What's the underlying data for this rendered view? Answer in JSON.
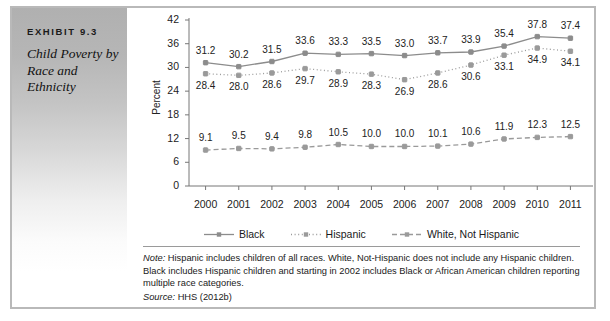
{
  "exhibit": {
    "label": "EXHIBIT 9.3",
    "title": "Child Poverty by Race and Ethnicity"
  },
  "notes": {
    "note_prefix": "Note:",
    "note_text": " Hispanic includes children of all races. White, Not-Hispanic does not include any Hispanic children. Black includes Hispanic children and starting in 2002 includes Black or African American children reporting multiple race categories.",
    "source_prefix": "Source:",
    "source_text": " HHS (2012b)"
  },
  "chart_data": {
    "type": "line",
    "title": "",
    "xlabel": "",
    "ylabel": "Percent",
    "ylim": [
      0,
      42
    ],
    "yticks": [
      0,
      6,
      12,
      18,
      24,
      30,
      36,
      42
    ],
    "grid": false,
    "legend_position": "bottom",
    "categories": [
      "2000",
      "2001",
      "2002",
      "2003",
      "2004",
      "2005",
      "2006",
      "2007",
      "2008",
      "2009",
      "2010",
      "2011"
    ],
    "series": [
      {
        "name": "Black",
        "style": "solid",
        "color": "#8c8c8c",
        "values": [
          31.2,
          30.2,
          31.5,
          33.6,
          33.3,
          33.5,
          33.0,
          33.7,
          33.9,
          35.4,
          37.8,
          37.4
        ],
        "label_offsets": [
          -1,
          -1,
          -1,
          -1,
          -1,
          -1,
          -1,
          -1,
          -1,
          -1,
          -1,
          -1
        ]
      },
      {
        "name": "Hispanic",
        "style": "dotted",
        "color": "#9a9a9a",
        "values": [
          28.4,
          28.0,
          28.6,
          29.7,
          28.9,
          28.3,
          26.9,
          28.6,
          30.6,
          33.1,
          34.9,
          34.1
        ],
        "label_offsets": [
          1,
          1,
          1,
          1,
          1,
          1,
          1,
          1,
          1,
          1,
          1,
          1
        ]
      },
      {
        "name": "White, Not Hispanic",
        "style": "dashed",
        "color": "#9a9a9a",
        "values": [
          9.1,
          9.5,
          9.4,
          9.8,
          10.5,
          10.0,
          10.0,
          10.1,
          10.6,
          11.9,
          12.3,
          12.5
        ],
        "label_offsets": [
          -1,
          -1,
          -1,
          -1,
          -1,
          -1,
          -1,
          -1,
          -1,
          -1,
          -1,
          -1
        ]
      }
    ]
  }
}
